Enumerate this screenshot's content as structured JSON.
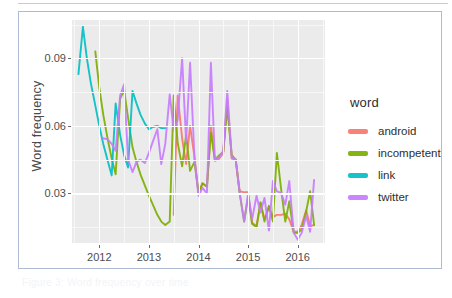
{
  "figure": {
    "caption": "Figure 3: Word frequency over time",
    "ylabel": "Word frequency",
    "xlabel": ""
  },
  "legend": {
    "title": "word",
    "items": [
      {
        "label": "android",
        "color": "#f8766d"
      },
      {
        "label": "incompetent",
        "color": "#7cae00"
      },
      {
        "label": "link",
        "color": "#00bfc4"
      },
      {
        "label": "twitter",
        "color": "#c77cff"
      }
    ]
  },
  "axes": {
    "y_ticks": [
      "0.03",
      "0.06",
      "0.09"
    ],
    "y_tick_values": [
      0.03,
      0.06,
      0.09
    ],
    "x_ticks": [
      "2012",
      "2013",
      "2014",
      "2015",
      "2016"
    ],
    "x_tick_values": [
      2012,
      2013,
      2014,
      2015,
      2016
    ]
  },
  "chart_data": {
    "type": "line",
    "title": "",
    "xlabel": "",
    "ylabel": "Word frequency",
    "xlim": [
      2011.45,
      2016.55
    ],
    "ylim": [
      0.008,
      0.107
    ],
    "grid": true,
    "legend_position": "right",
    "legend_title": "word",
    "x_ticks": [
      2012,
      2013,
      2014,
      2015,
      2016
    ],
    "y_ticks": [
      0.03,
      0.06,
      0.09
    ],
    "series": [
      {
        "name": "android",
        "color": "#f8766d",
        "x": [
          2013.5,
          2013.58,
          2013.67,
          2013.75,
          2013.83,
          2013.92,
          2014.0,
          2014.08,
          2014.17,
          2014.25,
          2014.33,
          2014.42,
          2014.5,
          2014.58,
          2014.67,
          2014.75,
          2014.83,
          2014.92,
          2015.0,
          2015.08,
          2015.17,
          2015.25,
          2015.33,
          2015.42,
          2015.5,
          2015.58,
          2015.67,
          2015.75,
          2015.83,
          2015.92,
          2016.0,
          2016.08,
          2016.17,
          2016.25,
          2016.33
        ],
        "y": [
          0.0205,
          0.0735,
          0.0545,
          0.043,
          0.06,
          0.046,
          0.03,
          0.0345,
          0.033,
          0.06,
          0.0445,
          0.0455,
          0.048,
          0.072,
          0.0455,
          0.045,
          0.031,
          0.0305,
          0.0305,
          0.017,
          0.0155,
          0.026,
          0.0185,
          0.024,
          0.0195,
          0.0205,
          0.0205,
          0.021,
          0.0185,
          0.013,
          0.013,
          0.016,
          0.0225,
          0.0155,
          0.016
        ]
      },
      {
        "name": "incompetent",
        "color": "#7cae00",
        "x": [
          2011.92,
          2012.0,
          2012.08,
          2012.17,
          2012.25,
          2012.33,
          2012.42,
          2012.5,
          2012.58,
          2012.67,
          2012.75,
          2012.83,
          2012.92,
          2013.0,
          2013.08,
          2013.17,
          2013.25,
          2013.33,
          2013.42,
          2013.5,
          2013.58,
          2013.67,
          2013.75,
          2013.83,
          2013.92,
          2014.0,
          2014.08,
          2014.17,
          2014.25,
          2014.33,
          2014.42,
          2014.5,
          2014.58,
          2014.67,
          2014.75,
          2014.83,
          2014.92,
          2015.0,
          2015.08,
          2015.17,
          2015.25,
          2015.33,
          2015.42,
          2015.5,
          2015.58,
          2015.67,
          2015.75,
          2015.83,
          2015.92,
          2016.0,
          2016.08,
          2016.17,
          2016.25,
          2016.33
        ],
        "y": [
          0.093,
          0.077,
          0.065,
          0.054,
          0.0455,
          0.0385,
          0.072,
          0.076,
          0.0635,
          0.0505,
          0.044,
          0.0385,
          0.0335,
          0.029,
          0.025,
          0.0205,
          0.0175,
          0.016,
          0.0175,
          0.0735,
          0.0525,
          0.042,
          0.056,
          0.04,
          0.044,
          0.03,
          0.0345,
          0.033,
          0.057,
          0.045,
          0.047,
          0.0485,
          0.068,
          0.047,
          0.045,
          0.03,
          0.0175,
          0.0285,
          0.0165,
          0.015,
          0.026,
          0.0175,
          0.0245,
          0.0175,
          0.048,
          0.031,
          0.0175,
          0.0265,
          0.0125,
          0.0125,
          0.014,
          0.022,
          0.031,
          0.016
        ]
      },
      {
        "name": "link",
        "color": "#00bfc4",
        "x": [
          2011.58,
          2011.67,
          2011.75,
          2011.83,
          2011.92,
          2012.0,
          2012.08,
          2012.17,
          2012.25,
          2012.33,
          2012.42,
          2012.5,
          2012.58,
          2012.67,
          2012.75,
          2012.83,
          2012.92,
          2013.0,
          2013.08,
          2013.17,
          2013.25,
          2013.33
        ],
        "y": [
          0.083,
          0.104,
          0.09,
          0.079,
          0.069,
          0.06,
          0.052,
          0.0445,
          0.038,
          0.07,
          0.056,
          0.047,
          0.0415,
          0.0755,
          0.07,
          0.065,
          0.061,
          0.0585,
          0.0595,
          0.06,
          0.059,
          0.059
        ]
      },
      {
        "name": "twitter",
        "color": "#c77cff",
        "x": [
          2012.08,
          2012.17,
          2012.25,
          2012.33,
          2012.42,
          2012.5,
          2012.58,
          2012.67,
          2012.75,
          2012.83,
          2012.92,
          2013.0,
          2013.08,
          2013.17,
          2013.25,
          2013.33,
          2013.42,
          2013.5,
          2013.58,
          2013.67,
          2013.75,
          2013.83,
          2013.92,
          2014.0,
          2014.08,
          2014.17,
          2014.25,
          2014.33,
          2014.42,
          2014.5,
          2014.58,
          2014.67,
          2014.75,
          2014.83,
          2014.92,
          2015.0,
          2015.08,
          2015.17,
          2015.25,
          2015.33,
          2015.42,
          2015.5,
          2015.58,
          2015.67,
          2015.75,
          2015.83,
          2015.92,
          2016.0,
          2016.08,
          2016.17,
          2016.25,
          2016.33
        ],
        "y": [
          0.0545,
          0.054,
          0.052,
          0.049,
          0.0735,
          0.0785,
          0.045,
          0.0395,
          0.044,
          0.045,
          0.0435,
          0.048,
          0.053,
          0.0585,
          0.043,
          0.052,
          0.074,
          0.058,
          0.0625,
          0.09,
          0.053,
          0.088,
          0.0455,
          0.029,
          0.0325,
          0.03,
          0.088,
          0.045,
          0.046,
          0.049,
          0.0755,
          0.046,
          0.045,
          0.0305,
          0.0175,
          0.03,
          0.0185,
          0.029,
          0.0215,
          0.028,
          0.0135,
          0.0355,
          0.031,
          0.03,
          0.025,
          0.0355,
          0.0125,
          0.0095,
          0.0125,
          0.02,
          0.013,
          0.036
        ]
      }
    ]
  }
}
